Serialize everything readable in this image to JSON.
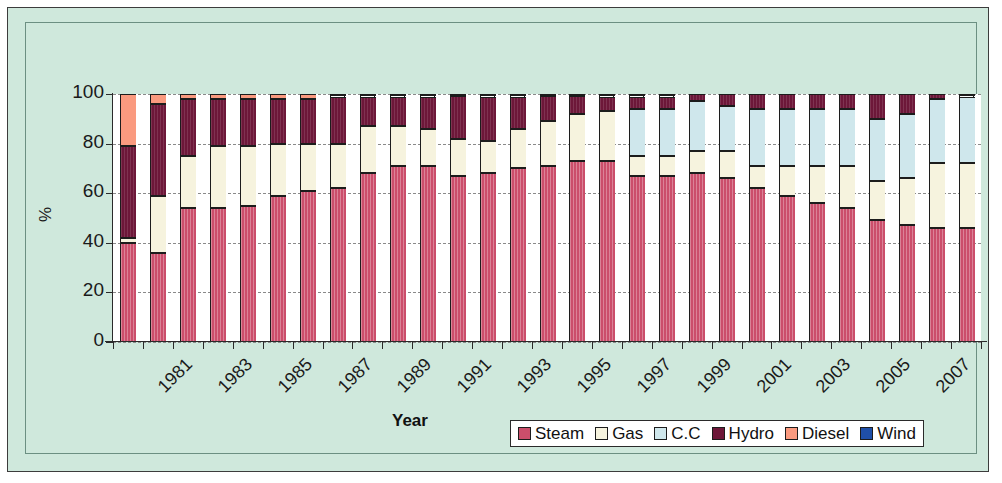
{
  "chart_data": {
    "type": "bar",
    "subtype": "stacked-100-percent",
    "title": "",
    "xlabel": "Year",
    "ylabel": "%",
    "ylim": [
      0,
      100
    ],
    "yticks": [
      0,
      20,
      40,
      60,
      80,
      100
    ],
    "grid": true,
    "legend_position": "bottom-right",
    "categories": [
      "1981",
      "1982",
      "1983",
      "1984",
      "1985",
      "1986",
      "1987",
      "1988",
      "1989",
      "1990",
      "1991",
      "1992",
      "1993",
      "1994",
      "1995",
      "1996",
      "1997",
      "1998",
      "1999",
      "2000",
      "2001",
      "2002",
      "2003",
      "2004",
      "2005",
      "2006",
      "2007",
      "2008",
      "2009"
    ],
    "tick_labels_shown": [
      "1981",
      "1983",
      "1985",
      "1987",
      "1989",
      "1991",
      "1993",
      "1995",
      "1997",
      "1999",
      "2001",
      "2003",
      "2005",
      "2007"
    ],
    "series": [
      {
        "name": "Steam",
        "color": "#cb4e6b",
        "values": [
          40,
          36,
          54,
          54,
          55,
          59,
          61,
          62,
          68,
          71,
          71,
          67,
          68,
          70,
          71,
          73,
          73,
          67,
          67,
          68,
          66,
          62,
          59,
          56,
          54,
          49,
          47,
          46,
          46
        ]
      },
      {
        "name": "Gas",
        "color": "#f6f3de",
        "values": [
          2,
          23,
          21,
          25,
          24,
          21,
          19,
          18,
          19,
          16,
          15,
          15,
          13,
          16,
          18,
          19,
          20,
          8,
          8,
          9,
          11,
          9,
          12,
          15,
          17,
          16,
          19,
          26,
          26
        ]
      },
      {
        "name": "C.C",
        "color": "#cfe7ec",
        "values": [
          0,
          0,
          0,
          0,
          0,
          0,
          0,
          0,
          0,
          0,
          0,
          0,
          0,
          0,
          0,
          0,
          0,
          19,
          19,
          20,
          18,
          23,
          23,
          23,
          23,
          25,
          26,
          26,
          27
        ]
      },
      {
        "name": "Hydro",
        "color": "#6d1739",
        "values": [
          37,
          37,
          23,
          19,
          19,
          18,
          18,
          19,
          12,
          12,
          13,
          17,
          18,
          13,
          10,
          7,
          6,
          5,
          5,
          3,
          5,
          6,
          6,
          6,
          6,
          10,
          8,
          2,
          1
        ]
      },
      {
        "name": "Diesel",
        "color": "#fa9a7f",
        "values": [
          21,
          4,
          2,
          2,
          2,
          2,
          2,
          1,
          1,
          1,
          1,
          1,
          1,
          1,
          1,
          1,
          1,
          1,
          1,
          0,
          0,
          0,
          0,
          0,
          0,
          0,
          0,
          0,
          0
        ]
      },
      {
        "name": "Wind",
        "color": "#1f4fa8",
        "values": [
          0,
          0,
          0,
          0,
          0,
          0,
          0,
          0,
          0,
          0,
          0,
          0,
          0,
          0,
          0,
          0,
          0,
          0,
          0,
          0,
          0,
          0,
          0,
          0,
          0,
          0,
          0,
          0,
          0
        ]
      }
    ]
  },
  "axis": {
    "y_title": "%",
    "x_title": "Year",
    "y_tick_labels": [
      "100",
      "80",
      "60",
      "40",
      "20",
      "0"
    ]
  },
  "legend": {
    "items": [
      {
        "label": "Steam",
        "color": "#cb4e6b",
        "icon": "legend-swatch-icon"
      },
      {
        "label": "Gas",
        "color": "#f6f3de",
        "icon": "legend-swatch-icon"
      },
      {
        "label": "C.C",
        "color": "#cfe7ec",
        "icon": "legend-swatch-icon"
      },
      {
        "label": "Hydro",
        "color": "#6d1739",
        "icon": "legend-swatch-icon"
      },
      {
        "label": "Diesel",
        "color": "#fa9a7f",
        "icon": "legend-swatch-icon"
      },
      {
        "label": "Wind",
        "color": "#1f4fa8",
        "icon": "legend-swatch-icon"
      }
    ]
  },
  "colors": {
    "background": "#cfe8dc",
    "plot_background": "#ffffff",
    "border": "#3c3c3c",
    "gridline": "#8a8a8a",
    "axis": "#2a2a2a"
  }
}
